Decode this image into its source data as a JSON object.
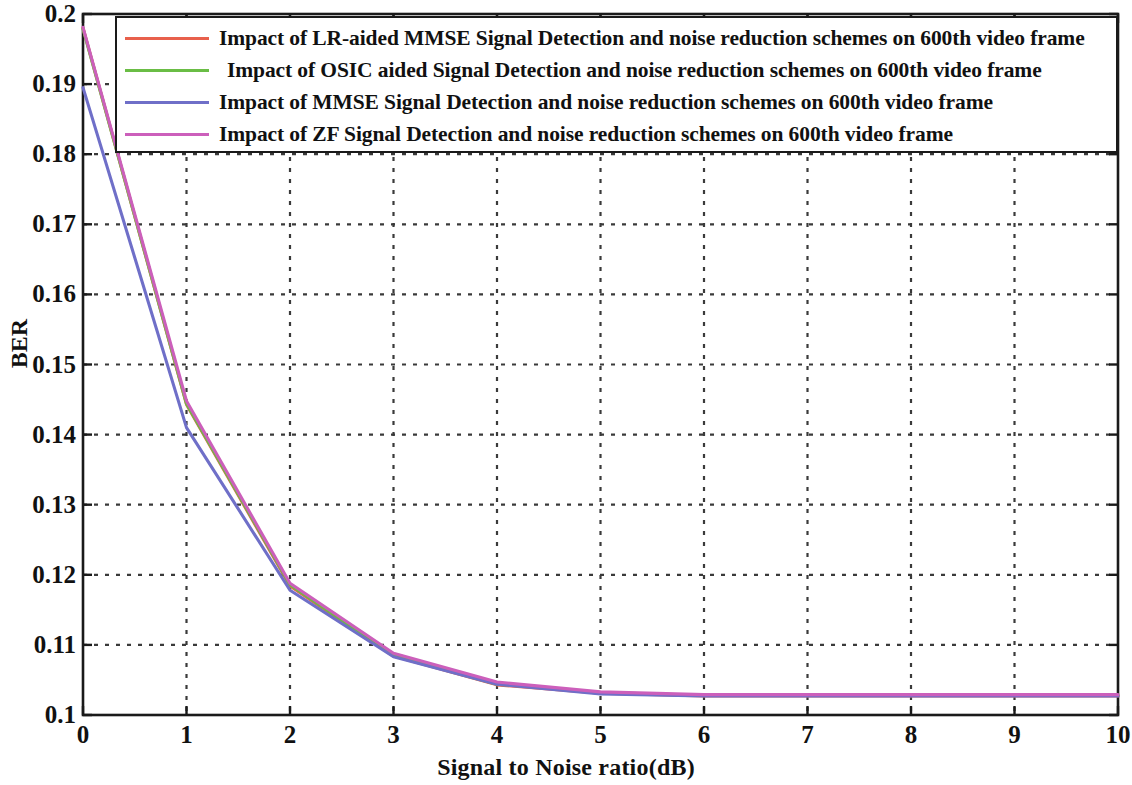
{
  "chart_data": {
    "type": "line",
    "title": "",
    "xlabel": "Signal to Noise ratio(dB)",
    "ylabel": "BER",
    "xlim": [
      0,
      10
    ],
    "ylim": [
      0.1,
      0.2
    ],
    "grid": true,
    "legend_position": "top",
    "x_ticks": [
      "0",
      "1",
      "2",
      "3",
      "4",
      "5",
      "6",
      "7",
      "8",
      "9",
      "10"
    ],
    "y_ticks": [
      "0.1",
      "0.11",
      "0.12",
      "0.13",
      "0.14",
      "0.15",
      "0.16",
      "0.17",
      "0.18",
      "0.19",
      "0.2"
    ],
    "x": [
      0,
      1,
      2,
      3,
      4,
      5,
      6,
      7,
      8,
      9,
      10
    ],
    "series": [
      {
        "name": "Impact of LR-aided MMSE Signal Detection  and noise reduction schemes on 600th  video frame",
        "color": "#e8604c",
        "values": [
          0.198,
          0.1443,
          0.1184,
          0.1084,
          0.1043,
          0.1031,
          0.1027,
          0.1027,
          0.1027,
          0.1027,
          0.1027
        ]
      },
      {
        "name": "Impact of OSIC aided Signal Detection  and noise reduction schemes on 600th  video frame",
        "color": "#6abd45",
        "values": [
          0.1979,
          0.1444,
          0.1186,
          0.1085,
          0.1044,
          0.1032,
          0.1028,
          0.1028,
          0.1028,
          0.1028,
          0.1028
        ]
      },
      {
        "name": "Impact of  MMSE Signal Detection  and noise reduction schemes on 600th  video frame",
        "color": "#6f6fc8",
        "values": [
          0.1895,
          0.141,
          0.1178,
          0.1083,
          0.1044,
          0.103,
          0.1027,
          0.1027,
          0.1027,
          0.1027,
          0.1027
        ]
      },
      {
        "name": "Impact of  ZF Signal Detection  and noise reduction schemes on 600th  video frame",
        "color": "#cc5fbb",
        "values": [
          0.1981,
          0.1448,
          0.1188,
          0.1088,
          0.1047,
          0.1033,
          0.1029,
          0.1029,
          0.1029,
          0.1029,
          0.1029
        ]
      }
    ]
  },
  "axes": {
    "y_title": "BER",
    "x_title": "Signal to Noise ratio(dB)"
  },
  "legend": {
    "items": [
      {
        "label": "Impact of LR-aided MMSE Signal Detection  and noise reduction schemes on 600th  video frame",
        "color": "#e8604c"
      },
      {
        "label": "Impact of OSIC aided Signal Detection  and noise reduction schemes on 600th  video frame",
        "color": "#6abd45"
      },
      {
        "label": "Impact of  MMSE Signal Detection  and noise reduction schemes on 600th  video frame",
        "color": "#6f6fc8"
      },
      {
        "label": "Impact of  ZF Signal Detection  and noise reduction schemes on 600th  video frame",
        "color": "#cc5fbb"
      }
    ]
  },
  "style": {
    "axis_color": "#1a1a1a",
    "grid_color": "#3a3a3a",
    "background": "#ffffff"
  }
}
